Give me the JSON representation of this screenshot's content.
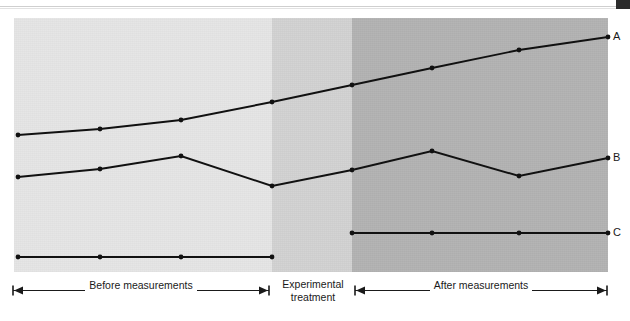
{
  "figure": {
    "caption_fragment": "",
    "series_labels": {
      "a": "A",
      "b": "B",
      "c": "C"
    },
    "phases": [
      {
        "id": "before",
        "label": "Before measurements",
        "label_line2": ""
      },
      {
        "id": "treatment",
        "label": "Experimental",
        "label_line2": "treatment"
      },
      {
        "id": "after",
        "label": "After measurements",
        "label_line2": ""
      }
    ],
    "colors": {
      "band_before": "#e6e6e6",
      "band_treatment": "#d2d2d2",
      "band_after": "#b3b3b3",
      "line": "#111111",
      "text": "#1a1a1a",
      "page_background": "#ffffff"
    }
  },
  "chart_data": {
    "type": "line",
    "title": "",
    "subtitle": "",
    "xlabel": "",
    "ylabel": "",
    "grid": false,
    "legend_position": "right-of-plot",
    "axis_visible": false,
    "xlim": [
      0,
      8
    ],
    "ylim": [
      0,
      10
    ],
    "x": [
      1,
      2,
      3,
      4,
      5,
      6,
      7,
      8
    ],
    "x_pixels": [
      18,
      100,
      181,
      272,
      352,
      432,
      519,
      608
    ],
    "phase_boundaries_px": [
      272,
      352
    ],
    "plot_area_px": {
      "left": 14,
      "top": 18,
      "width": 594,
      "height": 254
    },
    "annotations": [
      {
        "text": "Before measurements",
        "x_range": [
          1,
          4
        ]
      },
      {
        "text": "Experimental treatment",
        "x_range": [
          4,
          5
        ]
      },
      {
        "text": "After measurements",
        "x_range": [
          5,
          8
        ]
      }
    ],
    "series": [
      {
        "name": "A",
        "label": "A",
        "segments": [
          {
            "phase": "continuous",
            "points_px": [
              [
                18,
                135
              ],
              [
                100,
                129
              ],
              [
                181,
                120
              ],
              [
                272,
                102
              ],
              [
                352,
                85
              ],
              [
                432,
                68
              ],
              [
                519,
                50
              ],
              [
                608,
                37
              ]
            ],
            "values": [
              5.4,
              5.6,
              5.9,
              6.7,
              7.4,
              8.0,
              8.7,
              9.2
            ]
          }
        ]
      },
      {
        "name": "B",
        "label": "B",
        "segments": [
          {
            "phase": "continuous",
            "points_px": [
              [
                18,
                177
              ],
              [
                100,
                169
              ],
              [
                181,
                156
              ],
              [
                272,
                186
              ],
              [
                352,
                170
              ],
              [
                432,
                151
              ],
              [
                519,
                176
              ],
              [
                608,
                158
              ]
            ],
            "values": [
              3.8,
              4.1,
              4.6,
              3.4,
              4.0,
              4.8,
              3.8,
              4.5
            ]
          }
        ]
      },
      {
        "name": "C",
        "label": "C",
        "segments": [
          {
            "phase": "before",
            "points_px": [
              [
                18,
                257
              ],
              [
                100,
                257
              ],
              [
                181,
                257
              ],
              [
                272,
                257
              ]
            ],
            "values": [
              0.6,
              0.6,
              0.6,
              0.6
            ]
          },
          {
            "phase": "after",
            "points_px": [
              [
                352,
                233
              ],
              [
                432,
                233
              ],
              [
                519,
                233
              ],
              [
                608,
                233
              ]
            ],
            "values": [
              1.5,
              1.5,
              1.5,
              1.5
            ]
          }
        ]
      }
    ]
  }
}
